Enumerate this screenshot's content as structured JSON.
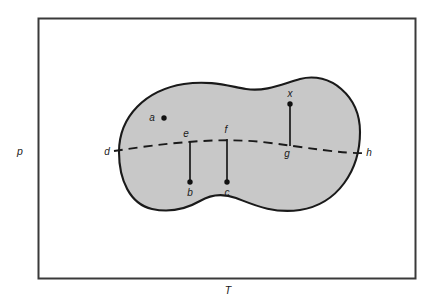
{
  "figure": {
    "kind": "state-space-diagram",
    "axes": {
      "y_label": "p",
      "x_label": "T"
    },
    "region": {
      "name": "shaded-region",
      "fill_color": "#c8c8c8",
      "stroke_color": "#1a1a1a"
    },
    "dashed_curve": {
      "name": "coexistence-curve",
      "stroke_color": "#1a1a1a",
      "start_label": "d",
      "end_label": "h"
    },
    "points": [
      {
        "id": "a",
        "label": "a",
        "has_dot": true,
        "label_side": "left"
      },
      {
        "id": "b",
        "label": "b",
        "has_dot": true,
        "label_side": "below"
      },
      {
        "id": "c",
        "label": "c",
        "has_dot": true,
        "label_side": "below"
      },
      {
        "id": "d",
        "label": "d",
        "has_dot": false,
        "label_side": "left"
      },
      {
        "id": "e",
        "label": "e",
        "has_dot": false,
        "label_side": "above"
      },
      {
        "id": "f",
        "label": "f",
        "has_dot": false,
        "label_side": "above"
      },
      {
        "id": "g",
        "label": "g",
        "has_dot": false,
        "label_side": "below"
      },
      {
        "id": "h",
        "label": "h",
        "has_dot": false,
        "label_side": "right"
      },
      {
        "id": "x",
        "label": "x",
        "has_dot": true,
        "label_side": "above"
      }
    ],
    "connectors": [
      {
        "from": "e",
        "to": "b"
      },
      {
        "from": "f",
        "to": "c"
      },
      {
        "from": "x",
        "to": "g"
      }
    ],
    "frame": {
      "stroke_color": "#3a3a3a",
      "fill_color": "#ffffff"
    }
  }
}
